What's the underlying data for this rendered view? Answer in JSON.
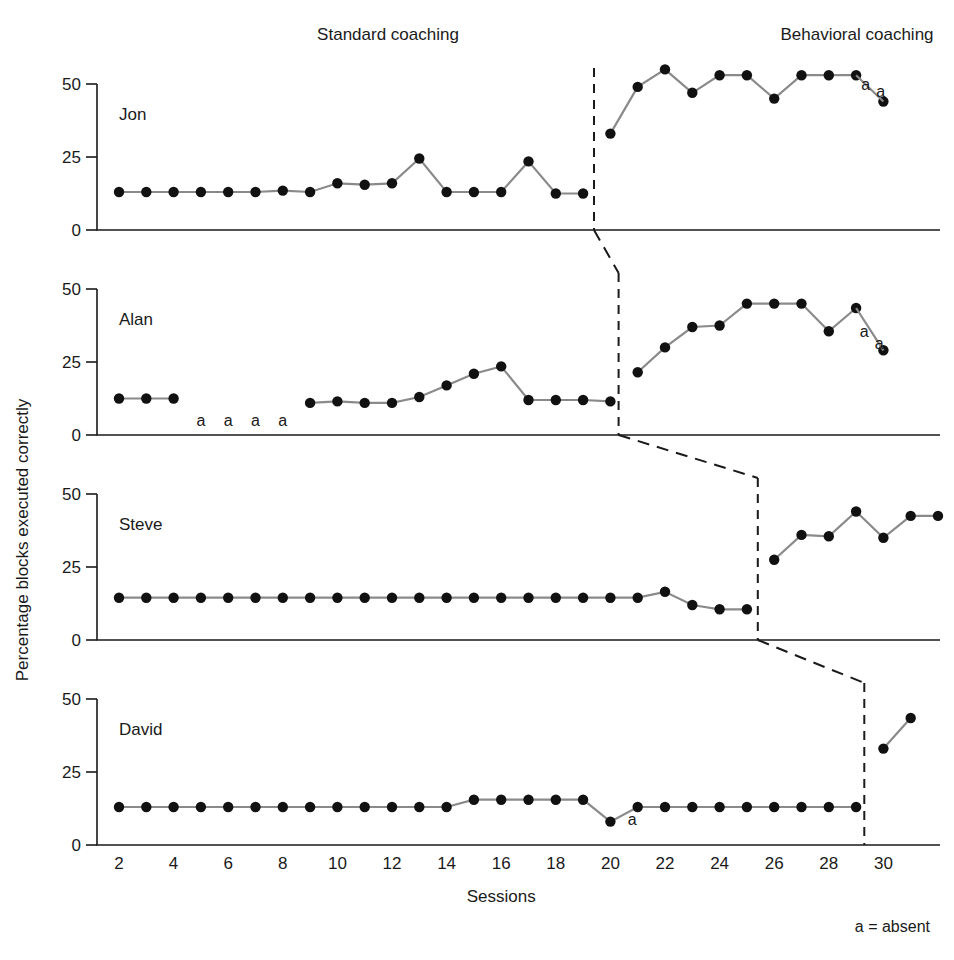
{
  "figure": {
    "ylabel": "Percentage blocks executed correctly",
    "xlabel": "Sessions",
    "legend_note": "a = absent",
    "phase_labels": {
      "baseline": "Standard coaching",
      "treatment": "Behavioral coaching"
    },
    "absent_glyph": "a"
  },
  "chart_data": {
    "type": "line",
    "title": "",
    "subtitle": "",
    "xlabel": "Sessions",
    "ylabel": "Percentage blocks executed correctly",
    "xlim": [
      1,
      31
    ],
    "ylim": [
      0,
      58
    ],
    "yticks": [
      0,
      25,
      50
    ],
    "xticks": [
      2,
      4,
      6,
      8,
      10,
      12,
      14,
      16,
      18,
      20,
      22,
      24,
      26,
      28,
      30
    ],
    "grid": false,
    "legend_position": "none",
    "legend_entries": [
      "a = absent"
    ],
    "phase_labels": [
      "Standard coaching",
      "Behavioral coaching"
    ],
    "annotations": [
      "a = absent"
    ],
    "marker": "filled-circle",
    "line_color": "#8a8a8a",
    "marker_color": "#111111",
    "panels": [
      {
        "name": "Jon",
        "phase_change_x": 19.4,
        "baseline": {
          "x": [
            2,
            3,
            4,
            5,
            6,
            7,
            8,
            9,
            10,
            11,
            12,
            13,
            14,
            15,
            16,
            17,
            18,
            19
          ],
          "y": [
            13,
            13,
            13,
            13,
            13,
            13,
            13.5,
            13,
            16,
            15.5,
            16,
            24.5,
            13,
            13,
            13,
            23.5,
            12.5,
            12.5
          ]
        },
        "treatment": [
          {
            "x": [
              20,
              21,
              22,
              23,
              24,
              25,
              26,
              27,
              28,
              29
            ],
            "y": [
              33,
              49,
              55,
              47,
              53,
              53,
              45,
              53,
              53,
              53
            ]
          },
          {
            "x": [
              30
            ],
            "y": [
              44
            ]
          }
        ],
        "absences": [
          {
            "x": 29.35,
            "y": 48,
            "label": "a"
          },
          {
            "x": 29.9,
            "y": 45.5,
            "label": "a"
          }
        ]
      },
      {
        "name": "Alan",
        "phase_change_x": 20.3,
        "baseline": {
          "x": [
            2,
            3,
            4,
            9,
            10,
            11,
            12,
            13,
            14,
            15,
            16,
            17,
            18,
            19,
            20
          ],
          "y": [
            12.5,
            12.5,
            12.5,
            11,
            11.5,
            11,
            11,
            13,
            17,
            21,
            23.5,
            12,
            12,
            12,
            11.5
          ]
        },
        "treatment": [
          {
            "x": [
              21,
              22,
              23,
              24,
              25,
              26,
              27,
              28,
              29
            ],
            "y": [
              21.5,
              30,
              37,
              37.5,
              45,
              45,
              45,
              35.5,
              43.5
            ]
          },
          {
            "x": [
              30
            ],
            "y": [
              29
            ]
          }
        ],
        "absences": [
          {
            "x": 5,
            "y": 3,
            "label": "a"
          },
          {
            "x": 6,
            "y": 3,
            "label": "a"
          },
          {
            "x": 7,
            "y": 3,
            "label": "a"
          },
          {
            "x": 8,
            "y": 3,
            "label": "a"
          },
          {
            "x": 29.3,
            "y": 33.5,
            "label": "a"
          },
          {
            "x": 29.85,
            "y": 29.5,
            "label": "a"
          }
        ]
      },
      {
        "name": "Steve",
        "phase_change_x": 25.4,
        "baseline": {
          "x": [
            2,
            3,
            4,
            5,
            6,
            7,
            8,
            9,
            10,
            11,
            12,
            13,
            14,
            15,
            16,
            17,
            18,
            19,
            20,
            21,
            22,
            23,
            24,
            25
          ],
          "y": [
            14.5,
            14.5,
            14.5,
            14.5,
            14.5,
            14.5,
            14.5,
            14.5,
            14.5,
            14.5,
            14.5,
            14.5,
            14.5,
            14.5,
            14.5,
            14.5,
            14.5,
            14.5,
            14.5,
            14.5,
            16.5,
            12,
            10.5,
            10.5
          ]
        },
        "treatment": [
          {
            "x": [
              26,
              27,
              28,
              29,
              30,
              31,
              32
            ],
            "y": [
              27.5,
              36,
              35.5,
              44,
              35,
              42.5,
              42.5
            ]
          }
        ],
        "absences": []
      },
      {
        "name": "David",
        "phase_change_x": 29.3,
        "baseline": {
          "x": [
            2,
            3,
            4,
            5,
            6,
            7,
            8,
            9,
            10,
            11,
            12,
            13,
            14,
            15,
            16,
            17,
            18,
            19,
            20,
            21,
            22,
            23,
            24,
            25,
            26,
            27,
            28,
            29
          ],
          "y": [
            13,
            13,
            13,
            13,
            13,
            13,
            13,
            13,
            13,
            13,
            13,
            13,
            13,
            15.5,
            15.5,
            15.5,
            15.5,
            15.5,
            8,
            13,
            13,
            13,
            13,
            13,
            13,
            13,
            13,
            13
          ]
        },
        "treatment": [
          {
            "x": [
              30,
              31
            ],
            "y": [
              33,
              43.5
            ]
          }
        ],
        "absences": [
          {
            "x": 20.8,
            "y": 7,
            "label": "a"
          }
        ]
      }
    ]
  }
}
